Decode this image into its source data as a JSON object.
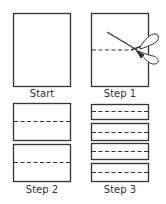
{
  "diagram": {
    "colors": {
      "stroke": "#333333",
      "background": "#ffffff"
    },
    "panels": [
      {
        "id": "start",
        "label": "Start",
        "description": "blank sheet of paper"
      },
      {
        "id": "step1",
        "label": "Step 1",
        "description": "cut sheet in half along dashed line with scissors",
        "icon": "scissors-icon"
      },
      {
        "id": "step2",
        "label": "Step 2",
        "description": "two halves, each with dashed cut line"
      },
      {
        "id": "step3",
        "label": "Step 3",
        "description": "four strips, each with dashed fold line"
      }
    ]
  }
}
